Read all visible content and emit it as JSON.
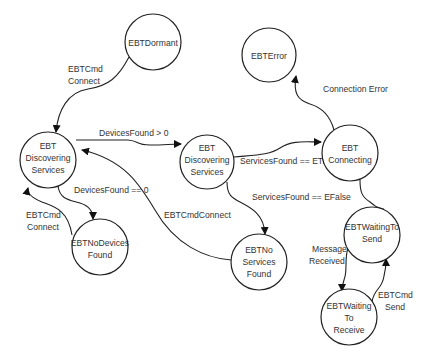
{
  "diagram": {
    "type": "state-machine",
    "states": [
      {
        "id": "dormant",
        "lines": [
          "EBTDormant"
        ],
        "cx": 153,
        "cy": 42,
        "r": 28
      },
      {
        "id": "error",
        "lines": [
          "EBTError"
        ],
        "cx": 269,
        "cy": 55,
        "r": 27
      },
      {
        "id": "discovering_left",
        "lines": [
          "EBT",
          "Discovering",
          "Services"
        ],
        "cx": 48,
        "cy": 160,
        "r": 28
      },
      {
        "id": "discovering_mid",
        "lines": [
          "EBT",
          "Discovering",
          "Services"
        ],
        "cx": 207,
        "cy": 162,
        "r": 27
      },
      {
        "id": "connecting",
        "lines": [
          "EBT",
          "Connecting"
        ],
        "cx": 350,
        "cy": 153,
        "r": 28
      },
      {
        "id": "no_devices",
        "lines": [
          "EBTNoDevices",
          "Found"
        ],
        "cx": 100,
        "cy": 247,
        "r": 28
      },
      {
        "id": "no_services",
        "lines": [
          "EBTNo",
          "Services",
          "Found"
        ],
        "cx": 259,
        "cy": 262,
        "r": 28
      },
      {
        "id": "waiting_send",
        "lines": [
          "EBTWaitingTo",
          "Send"
        ],
        "cx": 372,
        "cy": 235,
        "r": 28
      },
      {
        "id": "waiting_receive",
        "lines": [
          "EBTWaiting",
          "To",
          "Receive"
        ],
        "cx": 349,
        "cy": 317,
        "r": 28
      }
    ],
    "transitions": [
      {
        "from": "dormant",
        "to": "discovering_left",
        "label": [
          "EBTCmd",
          "Connect"
        ]
      },
      {
        "from": "discovering_left",
        "to": "discovering_mid",
        "label": [
          "DevicesFound > 0"
        ]
      },
      {
        "from": "discovering_left",
        "to": "no_devices",
        "label": [
          "DevicesFound == 0"
        ]
      },
      {
        "from": "no_devices",
        "to": "discovering_left",
        "label": [
          "EBTCmd",
          "Connect"
        ]
      },
      {
        "from": "no_services",
        "to": "discovering_left",
        "label": [
          "EBTCmdConnect"
        ]
      },
      {
        "from": "discovering_mid",
        "to": "connecting",
        "label": [
          "ServicesFound == ETrue"
        ]
      },
      {
        "from": "discovering_mid",
        "to": "no_services",
        "label": [
          "ServicesFound == EFalse"
        ]
      },
      {
        "from": "connecting",
        "to": "error",
        "label": [
          "Connection Error"
        ]
      },
      {
        "from": "connecting",
        "to": "waiting_send",
        "label": []
      },
      {
        "from": "waiting_send",
        "to": "waiting_receive",
        "label": [
          "Message",
          "Received"
        ]
      },
      {
        "from": "waiting_receive",
        "to": "waiting_send",
        "label": [
          "EBTCmd",
          "Send"
        ]
      }
    ]
  },
  "labels": {
    "dormant_to_disc": [
      "EBTCmd",
      "Connect"
    ],
    "devices_gt0": "DevicesFound > 0",
    "devices_eq0": "DevicesFound == 0",
    "nodev_connect": [
      "EBTCmd",
      "Connect"
    ],
    "cmd_connect": "EBTCmdConnect",
    "services_true": "ServicesFound == ETrue",
    "services_false": "ServicesFound == EFalse",
    "conn_error": "Connection Error",
    "msg_received": [
      "Message",
      "Received"
    ],
    "cmd_send": [
      "EBTCmd",
      "Send"
    ]
  },
  "state_text": {
    "dormant": [
      "EBTDormant"
    ],
    "error": [
      "EBTError"
    ],
    "disc_left": [
      "EBT",
      "Discovering",
      "Services"
    ],
    "disc_mid": [
      "EBT",
      "Discovering",
      "Services"
    ],
    "connecting": [
      "EBT",
      "Connecting"
    ],
    "no_devices": [
      "EBTNoDevices",
      "Found"
    ],
    "no_services": [
      "EBTNo",
      "Services",
      "Found"
    ],
    "wait_send": [
      "EBTWaitingTo",
      "Send"
    ],
    "wait_recv": [
      "EBTWaiting",
      "To",
      "Receive"
    ]
  }
}
